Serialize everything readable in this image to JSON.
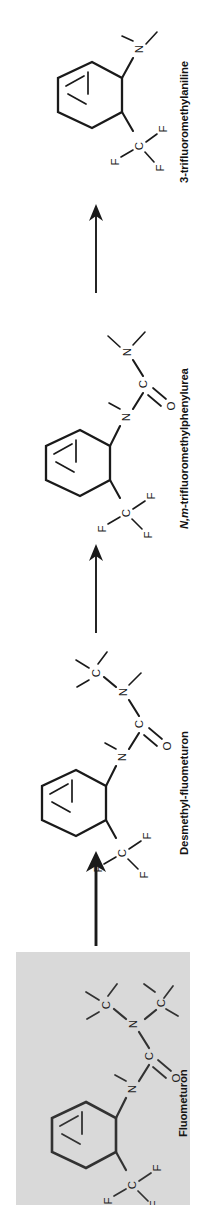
{
  "figure": {
    "kind": "chemical-degradation-pathway",
    "orientation": "rotated-90-ccw",
    "flow_direction": "bottom-to-top",
    "canvas": {
      "width": 206,
      "height": 1223
    },
    "background_color": "#ffffff",
    "line_color": "#1a1a1a",
    "highlight_box_color": "#d9d9d9"
  },
  "compounds": [
    {
      "id": "fluometuron",
      "label": "Fluometuron",
      "position": "bottom",
      "highlighted": true,
      "atom_labels": [
        "C",
        "C",
        "N",
        "C",
        "O",
        "N",
        "C",
        "F",
        "F",
        "F"
      ]
    },
    {
      "id": "desmethyl-fluometuron",
      "label": "Desmethyl-fluometuron",
      "position": "third",
      "highlighted": false,
      "atom_labels": [
        "C",
        "N",
        "C",
        "O",
        "N",
        "C",
        "F",
        "F",
        "F"
      ]
    },
    {
      "id": "n-m-trifluoromethylphenylurea",
      "label_parts": {
        "italic": "N,m-",
        "roman": "trifluoromethylphenylurea"
      },
      "label": "N,m-trifluoromethylphenylurea",
      "position": "second",
      "highlighted": false,
      "atom_labels": [
        "N",
        "C",
        "O",
        "N",
        "C",
        "F",
        "F",
        "F"
      ]
    },
    {
      "id": "3-trifluoromethylaniline",
      "label": "3-trifluoromethylaniline",
      "position": "top",
      "highlighted": false,
      "atom_labels": [
        "N",
        "C",
        "F",
        "F",
        "F"
      ]
    }
  ],
  "arrows": [
    {
      "id": "arrow-fluometuron-to-desmethyl",
      "from": "fluometuron",
      "to": "desmethyl-fluometuron",
      "style": "thick"
    },
    {
      "id": "arrow-desmethyl-to-phenylurea",
      "from": "desmethyl-fluometuron",
      "to": "n-m-trifluoromethylphenylurea",
      "style": "thin"
    },
    {
      "id": "arrow-phenylurea-to-aniline",
      "from": "n-m-trifluoromethylphenylurea",
      "to": "3-trifluoromethylaniline",
      "style": "thin"
    }
  ],
  "atoms": {
    "C": "C",
    "N": "N",
    "O": "O",
    "F": "F"
  }
}
